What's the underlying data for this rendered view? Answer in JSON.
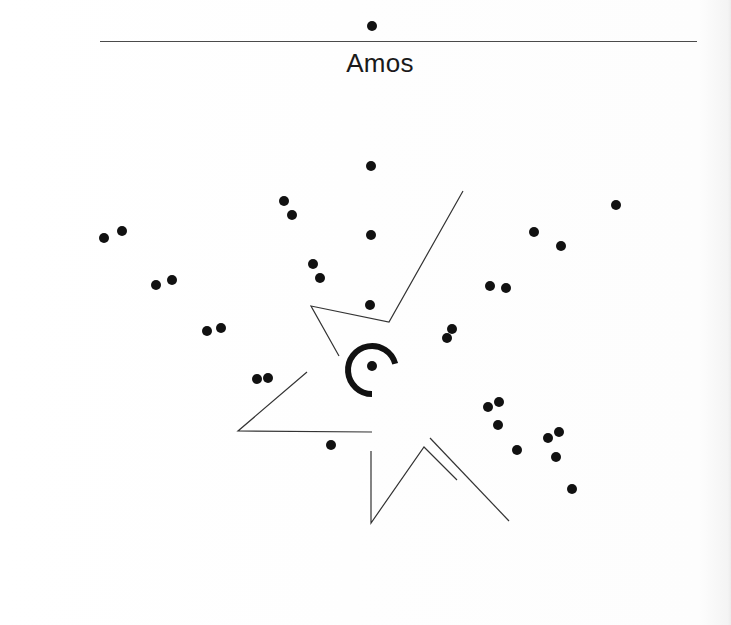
{
  "page": {
    "title": "Amos"
  },
  "colors": {
    "ink": "#111111",
    "line": "#333333",
    "rule": "#4a4a4a",
    "background": "#ffffff"
  },
  "diagram": {
    "dot_radius": 5,
    "top_dot": {
      "x": 372,
      "y": 26
    },
    "dots": [
      {
        "x": 104,
        "y": 238
      },
      {
        "x": 122,
        "y": 231
      },
      {
        "x": 156,
        "y": 285
      },
      {
        "x": 172,
        "y": 280
      },
      {
        "x": 207,
        "y": 331
      },
      {
        "x": 221,
        "y": 328
      },
      {
        "x": 257,
        "y": 379
      },
      {
        "x": 268,
        "y": 378
      },
      {
        "x": 284,
        "y": 201
      },
      {
        "x": 292,
        "y": 215
      },
      {
        "x": 313,
        "y": 264
      },
      {
        "x": 320,
        "y": 278
      },
      {
        "x": 371,
        "y": 166
      },
      {
        "x": 371,
        "y": 235
      },
      {
        "x": 370,
        "y": 305
      },
      {
        "x": 331,
        "y": 445
      },
      {
        "x": 616,
        "y": 205
      },
      {
        "x": 534,
        "y": 232
      },
      {
        "x": 561,
        "y": 246
      },
      {
        "x": 490,
        "y": 286
      },
      {
        "x": 506,
        "y": 288
      },
      {
        "x": 452,
        "y": 329
      },
      {
        "x": 447,
        "y": 338
      },
      {
        "x": 488,
        "y": 407
      },
      {
        "x": 499,
        "y": 402
      },
      {
        "x": 498,
        "y": 425
      },
      {
        "x": 517,
        "y": 450
      },
      {
        "x": 548,
        "y": 438
      },
      {
        "x": 559,
        "y": 432
      },
      {
        "x": 556,
        "y": 457
      },
      {
        "x": 572,
        "y": 489
      }
    ],
    "center_dot": {
      "x": 372,
      "y": 366,
      "r": 5
    },
    "arc": {
      "cx": 372,
      "cy": 370,
      "r": 24,
      "stroke_width": 6
    },
    "polylines": [
      {
        "name": "upper-wedge",
        "points": "463,191 389,322 311,306 339,356"
      },
      {
        "name": "left-wedge",
        "points": "307,372 238,431 372,432"
      },
      {
        "name": "lower-zigzag",
        "points": "371,451 371,523 424,447 457,480"
      },
      {
        "name": "lower-right-stroke",
        "points": "430,438 509,521"
      }
    ]
  }
}
